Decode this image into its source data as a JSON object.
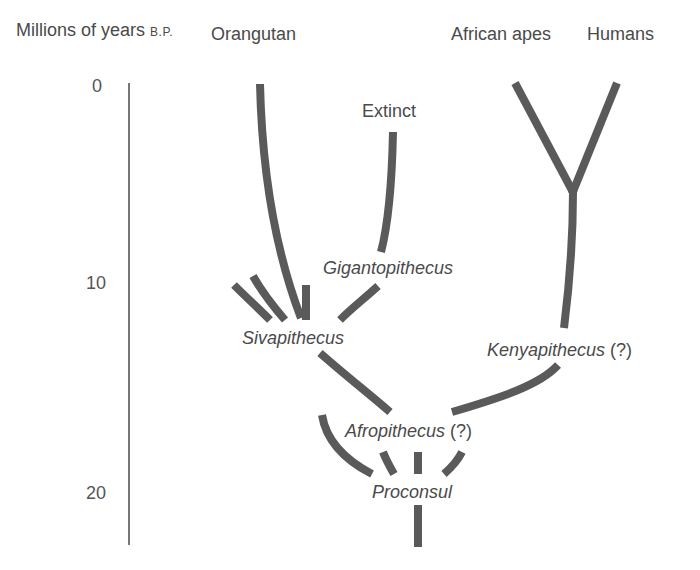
{
  "axis": {
    "title": "Millions of years",
    "title_suffix": "B.P.",
    "ticks": [
      {
        "label": "0",
        "value": 0
      },
      {
        "label": "10",
        "value": 10
      },
      {
        "label": "20",
        "value": 20
      }
    ]
  },
  "taxa": {
    "orangutan": "Orangutan",
    "extinct": "Extinct",
    "african_apes": "African apes",
    "humans": "Humans",
    "gigantopithecus": "Gigantopithecus",
    "sivapithecus": "Sivapithecus",
    "kenyapithecus": "Kenyapithecus",
    "kenyapithecus_q": "(?)",
    "afropithecus": "Afropithecus",
    "afropithecus_q": "(?)",
    "proconsul": "Proconsul"
  },
  "colors": {
    "branch": "#5a5a5a",
    "text": "#4a4a4a",
    "background": "#ffffff"
  }
}
